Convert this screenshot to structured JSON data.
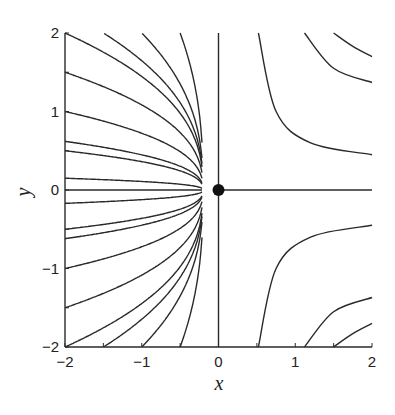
{
  "chart_data": {
    "type": "line",
    "title": "",
    "subtitle": "Phase portrait: trajectories near a node (fan) and hyperbolic flows in right half-plane",
    "xlabel": "x",
    "ylabel": "y",
    "xlim": [
      -2,
      2
    ],
    "ylim": [
      -2,
      2
    ],
    "xticks": [
      -2,
      -1,
      0,
      1,
      2
    ],
    "yticks": [
      -2,
      -1,
      0,
      1,
      2
    ],
    "xtick_labels": [
      "−2",
      "−1",
      "0",
      "1",
      "2"
    ],
    "ytick_labels": [
      "−2",
      "−1",
      "0",
      "1",
      "2"
    ],
    "grid": false,
    "legend": null,
    "fixed_point": {
      "x": 0,
      "y": 0,
      "marker": "filled-circle"
    },
    "node_point": {
      "x": -0.2,
      "y": 0
    },
    "axis_lines": [
      {
        "orientation": "vertical",
        "x": 0,
        "y_range": [
          -2,
          2
        ]
      },
      {
        "orientation": "horizontal",
        "y": 0,
        "x_range": [
          0,
          2
        ]
      }
    ],
    "fan_trajectories": {
      "description": "Curves converging to node at x=-0.2, y=0",
      "shape_exponent": 0.4,
      "left_edge_starts_y": [
        2,
        1.5,
        1,
        0.62,
        0.5,
        0.15,
        0,
        -0.17,
        -0.5,
        -0.62,
        -1,
        -1.5,
        -2
      ],
      "top_edge_starts_x": [
        -1.5,
        -1,
        -0.5
      ],
      "bottom_edge_starts_x": [
        -1.5,
        -1,
        -0.5
      ]
    },
    "hyperbolic_trajectories": [
      {
        "quadrant": "upper-right",
        "points": [
          [
            0.52,
            2
          ],
          [
            0.75,
            1.0
          ],
          [
            1.2,
            0.6
          ],
          [
            2,
            0.45
          ]
        ]
      },
      {
        "quadrant": "upper-right",
        "points": [
          [
            1.12,
            2
          ],
          [
            1.5,
            1.55
          ],
          [
            2,
            1.37
          ]
        ]
      },
      {
        "quadrant": "upper-right",
        "points": [
          [
            1.5,
            2
          ],
          [
            1.75,
            1.83
          ],
          [
            2,
            1.7
          ]
        ]
      },
      {
        "quadrant": "lower-right",
        "points": [
          [
            0.52,
            -2
          ],
          [
            0.75,
            -1.0
          ],
          [
            1.2,
            -0.6
          ],
          [
            2,
            -0.45
          ]
        ]
      },
      {
        "quadrant": "lower-right",
        "points": [
          [
            1.12,
            -2
          ],
          [
            1.5,
            -1.55
          ],
          [
            2,
            -1.37
          ]
        ]
      },
      {
        "quadrant": "lower-right",
        "points": [
          [
            1.5,
            -2
          ],
          [
            1.75,
            -1.83
          ],
          [
            2,
            -1.7
          ]
        ]
      }
    ]
  },
  "labels": {
    "x_axis": "x",
    "y_axis": "y"
  }
}
